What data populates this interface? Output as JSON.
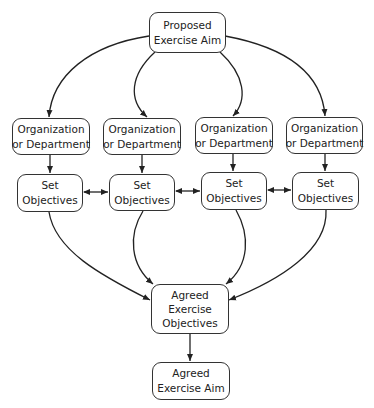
{
  "diagram": {
    "type": "flowchart",
    "nodes": {
      "proposed_aim": {
        "line1": "Proposed",
        "line2": "Exercise Aim"
      },
      "org": [
        {
          "line1": "Organization",
          "line2": "or Department"
        },
        {
          "line1": "Organization",
          "line2": "or Department"
        },
        {
          "line1": "Organization",
          "line2": "or Department"
        },
        {
          "line1": "Organization",
          "line2": "or Department"
        }
      ],
      "set_objectives": [
        {
          "line1": "Set",
          "line2": "Objectives"
        },
        {
          "line1": "Set",
          "line2": "Objectives"
        },
        {
          "line1": "Set",
          "line2": "Objectives"
        },
        {
          "line1": "Set",
          "line2": "Objectives"
        }
      ],
      "agreed_objectives": {
        "line1": "Agreed",
        "line2": "Exercise",
        "line3": "Objectives"
      },
      "agreed_aim": {
        "line1": "Agreed",
        "line2": "Exercise Aim"
      }
    },
    "edges": [
      {
        "from": "Proposed Exercise Aim",
        "to": "Organization or Department 1"
      },
      {
        "from": "Proposed Exercise Aim",
        "to": "Organization or Department 2"
      },
      {
        "from": "Proposed Exercise Aim",
        "to": "Organization or Department 3"
      },
      {
        "from": "Proposed Exercise Aim",
        "to": "Organization or Department 4"
      },
      {
        "from": "Organization or Department 1",
        "to": "Set Objectives 1"
      },
      {
        "from": "Organization or Department 2",
        "to": "Set Objectives 2"
      },
      {
        "from": "Organization or Department 3",
        "to": "Set Objectives 3"
      },
      {
        "from": "Organization or Department 4",
        "to": "Set Objectives 4"
      },
      {
        "from": "Set Objectives 1",
        "to": "Set Objectives 2",
        "bidirectional": true
      },
      {
        "from": "Set Objectives 2",
        "to": "Set Objectives 3",
        "bidirectional": true
      },
      {
        "from": "Set Objectives 3",
        "to": "Set Objectives 4",
        "bidirectional": true
      },
      {
        "from": "Set Objectives 1",
        "to": "Agreed Exercise Objectives"
      },
      {
        "from": "Set Objectives 2",
        "to": "Agreed Exercise Objectives"
      },
      {
        "from": "Set Objectives 3",
        "to": "Agreed Exercise Objectives"
      },
      {
        "from": "Set Objectives 4",
        "to": "Agreed Exercise Objectives"
      },
      {
        "from": "Agreed Exercise Objectives",
        "to": "Agreed Exercise Aim"
      }
    ],
    "colors": {
      "stroke": "#333333",
      "text": "#222222",
      "background": "#ffffff"
    }
  }
}
